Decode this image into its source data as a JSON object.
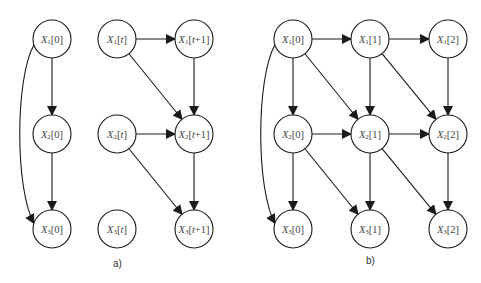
{
  "panels": [
    {
      "id": "a",
      "caption": "a)",
      "caption_pos": [
        118,
        265
      ],
      "nodes": [
        {
          "id": "a_x1_0",
          "var": "X",
          "sub": "1",
          "idx": "[0]",
          "x": 52,
          "y": 39
        },
        {
          "id": "a_x2_0",
          "var": "X",
          "sub": "2",
          "idx": "[0]",
          "x": 52,
          "y": 134
        },
        {
          "id": "a_x3_0",
          "var": "X",
          "sub": "3",
          "idx": "[0]",
          "x": 52,
          "y": 229
        },
        {
          "id": "a_x1_t",
          "var": "X",
          "sub": "1",
          "idx": "[t]",
          "x": 117,
          "y": 39
        },
        {
          "id": "a_x2_t",
          "var": "X",
          "sub": "2",
          "idx": "[t]",
          "x": 117,
          "y": 134
        },
        {
          "id": "a_x3_t",
          "var": "X",
          "sub": "3",
          "idx": "[t]",
          "x": 117,
          "y": 229
        },
        {
          "id": "a_x1_t1",
          "var": "X",
          "sub": "1",
          "idx": "[t+1]",
          "x": 194,
          "y": 39
        },
        {
          "id": "a_x2_t1",
          "var": "X",
          "sub": "2",
          "idx": "[t+1]",
          "x": 194,
          "y": 134
        },
        {
          "id": "a_x3_t1",
          "var": "X",
          "sub": "3",
          "idx": "[t+1]",
          "x": 194,
          "y": 229
        }
      ],
      "edges": [
        {
          "from": "a_x1_0",
          "to": "a_x2_0"
        },
        {
          "from": "a_x2_0",
          "to": "a_x3_0"
        },
        {
          "from": "a_x1_0",
          "to": "a_x3_0",
          "curved": true
        },
        {
          "from": "a_x1_t",
          "to": "a_x1_t1"
        },
        {
          "from": "a_x1_t",
          "to": "a_x2_t1"
        },
        {
          "from": "a_x1_t1",
          "to": "a_x2_t1"
        },
        {
          "from": "a_x2_t",
          "to": "a_x2_t1"
        },
        {
          "from": "a_x2_t",
          "to": "a_x3_t1"
        },
        {
          "from": "a_x2_t1",
          "to": "a_x3_t1"
        }
      ]
    },
    {
      "id": "b",
      "caption": "b)",
      "caption_pos": [
        371,
        262
      ],
      "nodes": [
        {
          "id": "b_x1_0",
          "var": "X",
          "sub": "1",
          "idx": "[0]",
          "x": 293,
          "y": 39
        },
        {
          "id": "b_x2_0",
          "var": "X",
          "sub": "2",
          "idx": "[0]",
          "x": 293,
          "y": 134
        },
        {
          "id": "b_x3_0",
          "var": "X",
          "sub": "3",
          "idx": "[0]",
          "x": 293,
          "y": 229
        },
        {
          "id": "b_x1_1",
          "var": "X",
          "sub": "1",
          "idx": "[1]",
          "x": 370,
          "y": 39
        },
        {
          "id": "b_x2_1",
          "var": "X",
          "sub": "2",
          "idx": "[1]",
          "x": 370,
          "y": 134
        },
        {
          "id": "b_x3_1",
          "var": "X",
          "sub": "3",
          "idx": "[1]",
          "x": 370,
          "y": 229
        },
        {
          "id": "b_x1_2",
          "var": "X",
          "sub": "1",
          "idx": "[2]",
          "x": 448,
          "y": 39
        },
        {
          "id": "b_x2_2",
          "var": "X",
          "sub": "2",
          "idx": "[2]",
          "x": 448,
          "y": 134
        },
        {
          "id": "b_x3_2",
          "var": "X",
          "sub": "3",
          "idx": "[2]",
          "x": 448,
          "y": 229
        }
      ],
      "edges": [
        {
          "from": "b_x1_0",
          "to": "b_x2_0"
        },
        {
          "from": "b_x2_0",
          "to": "b_x3_0"
        },
        {
          "from": "b_x1_0",
          "to": "b_x3_0",
          "curved": true
        },
        {
          "from": "b_x1_0",
          "to": "b_x1_1"
        },
        {
          "from": "b_x1_0",
          "to": "b_x2_1"
        },
        {
          "from": "b_x2_0",
          "to": "b_x2_1"
        },
        {
          "from": "b_x2_0",
          "to": "b_x3_1"
        },
        {
          "from": "b_x1_1",
          "to": "b_x2_1"
        },
        {
          "from": "b_x2_1",
          "to": "b_x3_1"
        },
        {
          "from": "b_x1_1",
          "to": "b_x1_2"
        },
        {
          "from": "b_x1_1",
          "to": "b_x2_2"
        },
        {
          "from": "b_x2_1",
          "to": "b_x2_2"
        },
        {
          "from": "b_x2_1",
          "to": "b_x3_2"
        },
        {
          "from": "b_x1_2",
          "to": "b_x2_2"
        },
        {
          "from": "b_x2_2",
          "to": "b_x3_2"
        }
      ]
    }
  ],
  "style": {
    "node_radius": 19,
    "stroke_color": "#1a1a1a",
    "label_color": "#444444"
  }
}
